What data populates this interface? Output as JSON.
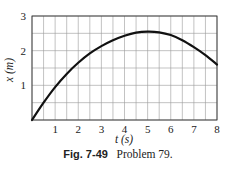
{
  "chart_data": {
    "type": "line",
    "title": "",
    "xlabel": "t (s)",
    "ylabel": "x (m)",
    "xlim": [
      0,
      8
    ],
    "ylim": [
      0,
      3
    ],
    "xticks": [
      1,
      2,
      3,
      4,
      5,
      6,
      7,
      8
    ],
    "yticks": [
      1,
      2,
      3
    ],
    "grid": true,
    "minor_grid_step": {
      "x": 0.5,
      "y": 0.5
    },
    "series": [
      {
        "name": "x(t)",
        "x": [
          0,
          0.5,
          1,
          1.5,
          2,
          2.5,
          3,
          3.5,
          4,
          4.5,
          5,
          5.5,
          6,
          6.5,
          7,
          7.5,
          8
        ],
        "values": [
          0,
          0.5,
          0.95,
          1.33,
          1.65,
          1.92,
          2.13,
          2.3,
          2.43,
          2.52,
          2.55,
          2.53,
          2.45,
          2.3,
          2.1,
          1.87,
          1.6
        ]
      }
    ],
    "legend": null
  },
  "caption": {
    "figure_label": "Fig. 7-49",
    "text": "Problem 79."
  },
  "colors": {
    "grid": "#9a9a9a",
    "axis": "#333333",
    "curve": "#111111",
    "text": "#222222"
  }
}
